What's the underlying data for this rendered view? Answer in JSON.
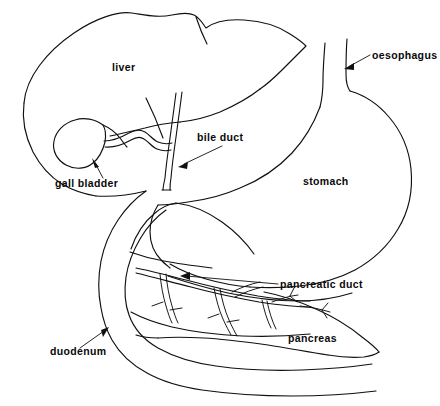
{
  "figure": {
    "type": "anatomical-line-diagram",
    "background_color": "#ffffff",
    "line_color": "#101010",
    "width": 440,
    "height": 406
  },
  "labels": {
    "liver": "liver",
    "gall_bladder": "gall bladder",
    "bile_duct": "bile duct",
    "oesophagus": "oesophagus",
    "stomach": "stomach",
    "pancreatic_duct": "pancreatic duct",
    "pancreas": "pancreas",
    "duodenum": "duodenum"
  },
  "label_positions": {
    "liver": {
      "x": 112,
      "y": 71,
      "has_leader": false
    },
    "gall_bladder": {
      "x": 55,
      "y": 187,
      "has_leader": true
    },
    "bile_duct": {
      "x": 197,
      "y": 141,
      "has_leader": true
    },
    "oesophagus": {
      "x": 372,
      "y": 59,
      "has_leader": true
    },
    "stomach": {
      "x": 303,
      "y": 185,
      "has_leader": false
    },
    "pancreatic_duct": {
      "x": 280,
      "y": 288,
      "has_leader": true
    },
    "pancreas": {
      "x": 288,
      "y": 342,
      "has_leader": false
    },
    "duodenum": {
      "x": 50,
      "y": 355,
      "has_leader": true
    }
  },
  "structures": [
    {
      "name": "liver",
      "kind": "organ"
    },
    {
      "name": "gall-bladder",
      "kind": "organ"
    },
    {
      "name": "cystic-duct",
      "kind": "duct"
    },
    {
      "name": "bile-duct",
      "kind": "duct"
    },
    {
      "name": "oesophagus",
      "kind": "organ"
    },
    {
      "name": "stomach",
      "kind": "organ"
    },
    {
      "name": "duodenum",
      "kind": "organ"
    },
    {
      "name": "pancreas",
      "kind": "organ"
    },
    {
      "name": "pancreatic-duct",
      "kind": "duct"
    }
  ]
}
